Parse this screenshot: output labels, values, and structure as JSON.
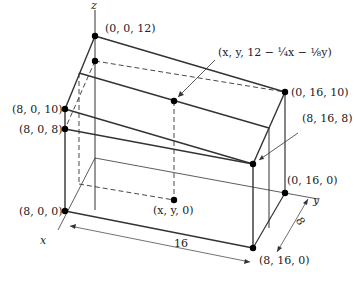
{
  "diagram": {
    "axes": {
      "x": "x",
      "y": "y",
      "z": "z"
    },
    "points": {
      "p0012": "(0, 0, 12)",
      "p8010": "(8, 0, 10)",
      "p808": "(8, 0, 8)",
      "p800": "(8, 0, 0)",
      "pxyz": "(x, y, 12 − ¼x − ⅛y)",
      "pxy0": "(x, y, 0)",
      "p01610": "(0, 16, 10)",
      "p8168": "(8, 16, 8)",
      "p0160": "(0, 16, 0)",
      "p8160": "(8, 16, 0)"
    },
    "dimensions": {
      "length": "16",
      "width": "8"
    }
  }
}
